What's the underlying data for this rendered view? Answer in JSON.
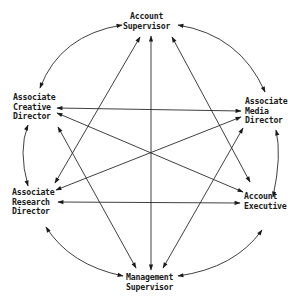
{
  "diagram": {
    "type": "communication-network",
    "nodes": [
      {
        "id": "as",
        "lines": [
          "Account",
          "Supervisor"
        ]
      },
      {
        "id": "acd",
        "lines": [
          "Associate",
          "Creative",
          "Director"
        ]
      },
      {
        "id": "amd",
        "lines": [
          "Associate",
          "Media",
          "Director"
        ]
      },
      {
        "id": "ard",
        "lines": [
          "Associate",
          "Research",
          "Director"
        ]
      },
      {
        "id": "ae",
        "lines": [
          "Account",
          "Executive"
        ]
      },
      {
        "id": "ms",
        "lines": [
          "Management",
          "Supervisor"
        ]
      }
    ],
    "edges": [
      {
        "from": "as",
        "to": "acd",
        "style": "arc",
        "bidirectional": true
      },
      {
        "from": "as",
        "to": "amd",
        "style": "arc",
        "bidirectional": true
      },
      {
        "from": "acd",
        "to": "ard",
        "style": "arc",
        "bidirectional": true
      },
      {
        "from": "amd",
        "to": "ae",
        "style": "arc",
        "bidirectional": true
      },
      {
        "from": "ard",
        "to": "ms",
        "style": "arc",
        "bidirectional": true
      },
      {
        "from": "ae",
        "to": "ms",
        "style": "arc",
        "bidirectional": true
      },
      {
        "from": "acd",
        "to": "amd",
        "style": "line",
        "bidirectional": true
      },
      {
        "from": "ard",
        "to": "ae",
        "style": "line",
        "bidirectional": true
      },
      {
        "from": "as",
        "to": "ms",
        "style": "line",
        "bidirectional": true
      },
      {
        "from": "acd",
        "to": "ae",
        "style": "line",
        "bidirectional": true
      },
      {
        "from": "amd",
        "to": "ard",
        "style": "line",
        "bidirectional": true
      },
      {
        "from": "as",
        "to": "ard",
        "style": "line",
        "bidirectional": true
      },
      {
        "from": "as",
        "to": "ae",
        "style": "line",
        "bidirectional": true
      },
      {
        "from": "acd",
        "to": "ms",
        "style": "line",
        "bidirectional": true
      },
      {
        "from": "amd",
        "to": "ms",
        "style": "line",
        "bidirectional": true
      }
    ],
    "colors": {
      "ink": "#1a1a1a",
      "background": "#ffffff"
    }
  }
}
